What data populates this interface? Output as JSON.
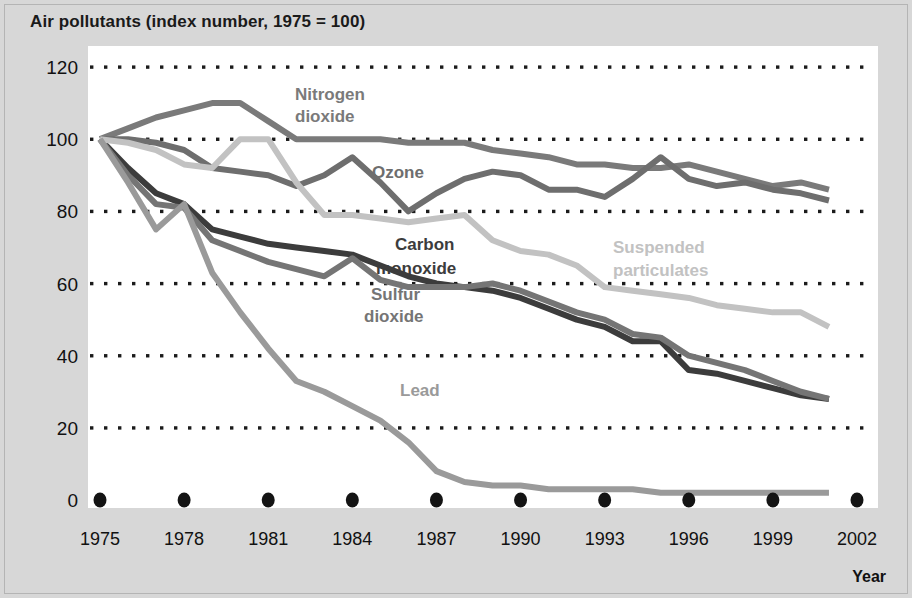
{
  "chart": {
    "title": "Air pollutants (index number, 1975 = 100)",
    "axis_year_label": "Year"
  },
  "labels": {
    "nitrogen_dioxide": "Nitrogen\ndioxide",
    "nitrogen_dioxide_l1": "Nitrogen",
    "nitrogen_dioxide_l2": "dioxide",
    "ozone": "Ozone",
    "carbon_monoxide_l1": "Carbon",
    "carbon_monoxide_l2": "monoxide",
    "sulfur_dioxide_l1": "Sulfur",
    "sulfur_dioxide_l2": "dioxide",
    "suspended_particulates_l1": "Suspended",
    "suspended_particulates_l2": "particulates",
    "lead": "Lead"
  },
  "colors": {
    "background": "#d7d7d7",
    "plot_background": "#ffffff",
    "grid": "#1b1b1b",
    "nitrogen_dioxide": "#7a7a7a",
    "ozone": "#6e6e6e",
    "carbon_monoxide": "#3c3c3c",
    "sulfur_dioxide": "#757575",
    "suspended_particulates": "#c2c2c2",
    "lead": "#9a9a9a",
    "title_text": "#1a1a1a",
    "tick_text": "#111111"
  },
  "chart_data": {
    "type": "line",
    "title": "Air pollutants (index number, 1975 = 100)",
    "xlabel": "Year",
    "ylabel": "",
    "xlim": [
      1975,
      2002
    ],
    "ylim": [
      0,
      120
    ],
    "yticks": [
      0,
      20,
      40,
      60,
      80,
      100,
      120
    ],
    "xticks": [
      1975,
      1978,
      1981,
      1984,
      1987,
      1990,
      1993,
      1996,
      1999,
      2002
    ],
    "grid": "horizontal-dotted",
    "legend": "inline-labels",
    "x": [
      1975,
      1976,
      1977,
      1978,
      1979,
      1980,
      1981,
      1982,
      1983,
      1984,
      1985,
      1986,
      1987,
      1988,
      1989,
      1990,
      1991,
      1992,
      1993,
      1994,
      1995,
      1996,
      1997,
      1998,
      1999,
      2000,
      2001
    ],
    "series": [
      {
        "name": "Nitrogen dioxide",
        "color": "#7a7a7a",
        "values": [
          100,
          103,
          106,
          108,
          110,
          110,
          105,
          100,
          100,
          100,
          100,
          99,
          99,
          99,
          97,
          96,
          95,
          93,
          93,
          92,
          92,
          93,
          91,
          89,
          87,
          88,
          86
        ]
      },
      {
        "name": "Ozone",
        "color": "#6e6e6e",
        "values": [
          100,
          100,
          99,
          97,
          92,
          91,
          90,
          87,
          90,
          95,
          88,
          80,
          85,
          89,
          91,
          90,
          86,
          86,
          84,
          89,
          95,
          89,
          87,
          88,
          86,
          85,
          83
        ]
      },
      {
        "name": "Carbon monoxide",
        "color": "#3c3c3c",
        "values": [
          100,
          92,
          85,
          82,
          75,
          73,
          71,
          70,
          69,
          68,
          65,
          62,
          60,
          59,
          58,
          56,
          53,
          50,
          48,
          44,
          44,
          36,
          35,
          33,
          31,
          29,
          28
        ]
      },
      {
        "name": "Sulfur dioxide",
        "color": "#757575",
        "values": [
          100,
          90,
          82,
          81,
          72,
          69,
          66,
          64,
          62,
          67,
          61,
          59,
          59,
          59,
          60,
          58,
          55,
          52,
          50,
          46,
          45,
          40,
          38,
          36,
          33,
          30,
          28
        ]
      },
      {
        "name": "Suspended particulates",
        "color": "#c2c2c2",
        "values": [
          100,
          99,
          97,
          93,
          92,
          100,
          100,
          88,
          79,
          79,
          78,
          77,
          78,
          79,
          72,
          69,
          68,
          65,
          59,
          58,
          57,
          56,
          54,
          53,
          52,
          52,
          48
        ]
      },
      {
        "name": "Lead",
        "color": "#9a9a9a",
        "values": [
          100,
          88,
          75,
          82,
          63,
          52,
          42,
          33,
          30,
          26,
          22,
          16,
          8,
          5,
          4,
          4,
          3,
          3,
          3,
          3,
          2,
          2,
          2,
          2,
          2,
          2,
          2
        ]
      }
    ]
  }
}
